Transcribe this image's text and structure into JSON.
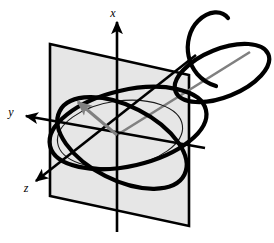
{
  "figure": {
    "background_color": "#ffffff",
    "width": 274,
    "height": 243
  },
  "axes": [
    {
      "id": "x",
      "label": "x",
      "label_pos": {
        "x": 116,
        "y": 14
      },
      "direction": "up",
      "line": {
        "x1": 117,
        "y1": 19,
        "x2": 117,
        "y2": 232
      },
      "arrow_at": {
        "x": 117,
        "y": 19
      },
      "color": "#000000",
      "width": 2.6
    },
    {
      "id": "y",
      "label": "y",
      "label_pos": {
        "x": 9,
        "y": 116
      },
      "direction": "left",
      "line": {
        "x1": 22,
        "y1": 116,
        "x2": 205,
        "y2": 148
      },
      "arrow_at": {
        "x": 22,
        "y": 116
      },
      "color": "#000000",
      "width": 2.6
    },
    {
      "id": "z",
      "label": "z",
      "label_pos": {
        "x": 22,
        "y": 190
      },
      "direction": "down-left",
      "line": {
        "x1": 33,
        "y1": 183,
        "x2": 196,
        "y2": 55
      },
      "arrow_at": {
        "x": 33,
        "y": 183
      },
      "color": "#000000",
      "width": 2.6
    }
  ],
  "plane": {
    "name": "shaded-plane",
    "fill": "#e6e6e6",
    "stroke": "#000000",
    "stroke_width": 2.6,
    "corners": [
      {
        "x": 50,
        "y": 44
      },
      {
        "x": 189,
        "y": 75
      },
      {
        "x": 189,
        "y": 226
      },
      {
        "x": 50,
        "y": 196
      }
    ]
  },
  "vector": {
    "name": "gray-vector",
    "color": "#808080",
    "width": 3,
    "from": {
      "x": 117,
      "y": 135
    },
    "to": {
      "x": 74,
      "y": 99
    },
    "has_arrowhead": true
  },
  "gray_ray": {
    "name": "gray-ray",
    "color": "#808080",
    "width": 2.6,
    "from": {
      "x": 117,
      "y": 135
    },
    "to": {
      "x": 250,
      "y": 52
    },
    "has_arrowhead": false
  },
  "thin_ellipse": {
    "name": "equator-ellipse",
    "stroke": "#1a1a1a",
    "stroke_width": 1.1,
    "center": {
      "x": 120,
      "y": 134
    },
    "rx": 63,
    "ry": 33,
    "rotation_deg": -8
  },
  "thick_curves": [
    {
      "name": "orbit-ellipse-main",
      "stroke": "#000000",
      "stroke_width": 4.2,
      "description": "large tilted ellipse through origin region"
    },
    {
      "name": "orbit-ellipse-secondary",
      "stroke": "#000000",
      "stroke_width": 4.2,
      "description": "second tilted ellipse crossing the first"
    },
    {
      "name": "spiral-tail",
      "stroke": "#000000",
      "stroke_width": 4.2,
      "description": "spiral hook arcing to upper right"
    }
  ],
  "colors": {
    "ink": "#000000",
    "gray_accent": "#808080",
    "plane_fill": "#e6e6e6"
  }
}
